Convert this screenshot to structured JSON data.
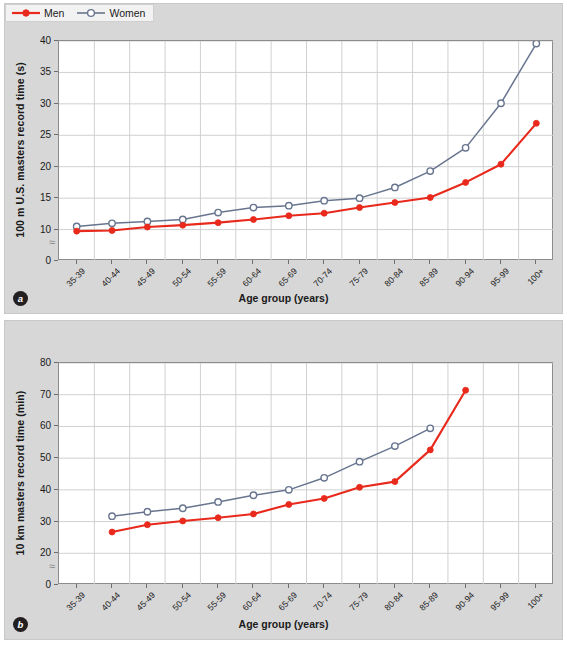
{
  "figure": {
    "background_color": "#d7d7d7",
    "plot_background": "#ffffff",
    "men_color": "#e8291c",
    "women_color": "#68758f",
    "grid_color": "#d0d0d0",
    "axis_color": "#8c8c8c"
  },
  "legend": {
    "men_label": "Men",
    "women_label": "Women"
  },
  "panels": {
    "a": {
      "tag": "a"
    },
    "b": {
      "tag": "b"
    }
  },
  "chart_data": [
    {
      "type": "line",
      "panel": "a",
      "title": "",
      "xlabel": "Age group (years)",
      "ylabel": "100 m U.S. masters record time (s)",
      "categories": [
        "35-39",
        "40-44",
        "45-49",
        "50-54",
        "55-59",
        "60-64",
        "65-69",
        "70-74",
        "75-79",
        "80-84",
        "85-89",
        "90-94",
        "95-99",
        "100+"
      ],
      "yticks": [
        0,
        10,
        15,
        20,
        25,
        30,
        35,
        40
      ],
      "ylim": [
        0,
        40
      ],
      "axis_break": true,
      "axis_break_between": [
        0,
        10
      ],
      "grid": true,
      "legend_position": "top-left",
      "series": [
        {
          "name": "Men",
          "color": "#e8291c",
          "marker": "filled-circle",
          "values": [
            9.5,
            9.7,
            10.4,
            10.7,
            11.1,
            11.6,
            12.2,
            12.6,
            13.5,
            14.3,
            15.1,
            17.5,
            20.4,
            26.9
          ]
        },
        {
          "name": "Women",
          "color": "#68758f",
          "marker": "open-circle",
          "values": [
            10.5,
            11.0,
            11.3,
            11.6,
            12.7,
            13.5,
            13.8,
            14.6,
            15.0,
            16.7,
            19.3,
            23.0,
            30.1,
            39.6
          ]
        }
      ]
    },
    {
      "type": "line",
      "panel": "b",
      "title": "",
      "xlabel": "Age group (years)",
      "ylabel": "10 km masters record time (min)",
      "categories": [
        "35-39",
        "40-44",
        "45-49",
        "50-54",
        "55-59",
        "60-64",
        "65-69",
        "70-74",
        "75-79",
        "80-84",
        "85-89",
        "90-94",
        "95-99",
        "100+"
      ],
      "yticks": [
        0,
        20,
        30,
        40,
        50,
        60,
        70,
        80
      ],
      "ylim": [
        0,
        80
      ],
      "axis_break": true,
      "axis_break_between": [
        0,
        20
      ],
      "grid": true,
      "legend_position": "none",
      "series": [
        {
          "name": "Men",
          "color": "#e8291c",
          "marker": "filled-circle",
          "values": [
            null,
            26.7,
            29.0,
            30.2,
            31.2,
            32.4,
            35.4,
            37.3,
            40.8,
            42.6,
            52.6,
            71.4,
            null,
            null
          ]
        },
        {
          "name": "Women",
          "color": "#68758f",
          "marker": "open-circle",
          "values": [
            null,
            31.7,
            33.1,
            34.2,
            36.2,
            38.3,
            40.0,
            43.8,
            48.9,
            53.8,
            59.4,
            null,
            null,
            null
          ]
        }
      ]
    }
  ]
}
